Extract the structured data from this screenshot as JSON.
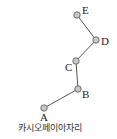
{
  "caption": "카시오페이아자리",
  "stars": [
    {
      "id": "A",
      "label": "A",
      "x": 44,
      "y": 108,
      "lx": 40,
      "ly": 121
    },
    {
      "id": "B",
      "label": "B",
      "x": 78,
      "y": 89,
      "lx": 82,
      "ly": 98
    },
    {
      "id": "C",
      "label": "C",
      "x": 76,
      "y": 61,
      "lx": 65,
      "ly": 71
    },
    {
      "id": "D",
      "label": "D",
      "x": 96,
      "y": 40,
      "lx": 101,
      "ly": 45
    },
    {
      "id": "E",
      "label": "E",
      "x": 77,
      "y": 15,
      "lx": 82,
      "ly": 14
    }
  ],
  "lines": [
    [
      "A",
      "B"
    ],
    [
      "B",
      "C"
    ],
    [
      "C",
      "D"
    ],
    [
      "D",
      "E"
    ]
  ],
  "colors": {
    "star_fill": "#c8c8c8",
    "star_stroke": "#555555",
    "line": "#555555"
  }
}
